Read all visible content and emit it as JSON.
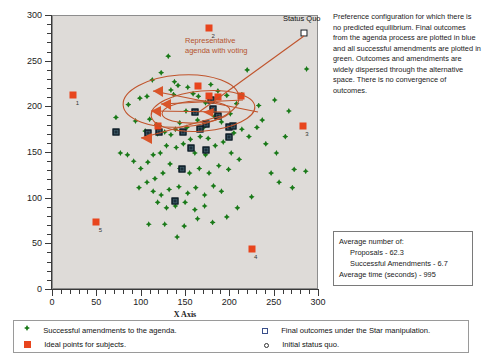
{
  "chart_data": {
    "type": "scatter",
    "title": "",
    "xlabel": "X Axis",
    "ylabel": "",
    "xlim": [
      0,
      300
    ],
    "ylim": [
      0,
      300
    ],
    "xticks": [
      0,
      50,
      100,
      150,
      200,
      250,
      300
    ],
    "yticks": [
      0,
      50,
      100,
      150,
      200,
      250,
      300
    ],
    "minor_tick_step": 10,
    "grid": false,
    "plot_background": "#dedbd8",
    "annotations": [
      {
        "name": "agenda-annotation",
        "text": "Representative\nagenda with voting",
        "color": "#b4532f"
      },
      {
        "name": "status-quo-annotation",
        "text": "Status Quo",
        "color": "#111111"
      }
    ],
    "series": [
      {
        "name": "Successful amendments to the agenda.",
        "marker": "diamond",
        "color": "#1a7a19",
        "points": [
          [
            130,
            256
          ],
          [
            122,
            238
          ],
          [
            112,
            230
          ],
          [
            137,
            228
          ],
          [
            141,
            224
          ],
          [
            133,
            219
          ],
          [
            136,
            214
          ],
          [
            152,
            222
          ],
          [
            158,
            215
          ],
          [
            164,
            212
          ],
          [
            98,
            210
          ],
          [
            106,
            212
          ],
          [
            85,
            203
          ],
          [
            71,
            189
          ],
          [
            93,
            185
          ],
          [
            109,
            187
          ],
          [
            117,
            181
          ],
          [
            120,
            180
          ],
          [
            178,
            225
          ],
          [
            186,
            218
          ],
          [
            196,
            213
          ],
          [
            172,
            205
          ],
          [
            150,
            196
          ],
          [
            160,
            195
          ],
          [
            143,
            183
          ],
          [
            151,
            178
          ],
          [
            138,
            176
          ],
          [
            126,
            173
          ],
          [
            133,
            170
          ],
          [
            118,
            171
          ],
          [
            104,
            174
          ],
          [
            163,
            186
          ],
          [
            170,
            178
          ],
          [
            182,
            190
          ],
          [
            190,
            184
          ],
          [
            200,
            193
          ],
          [
            207,
            204
          ],
          [
            213,
            214
          ],
          [
            219,
            241
          ],
          [
            232,
            202
          ],
          [
            175,
            166
          ],
          [
            166,
            168
          ],
          [
            155,
            165
          ],
          [
            147,
            160
          ],
          [
            139,
            156
          ],
          [
            128,
            158
          ],
          [
            121,
            150
          ],
          [
            113,
            148
          ],
          [
            107,
            140
          ],
          [
            99,
            133
          ],
          [
            91,
            141
          ],
          [
            84,
            148
          ],
          [
            76,
            150
          ],
          [
            160,
            150
          ],
          [
            172,
            148
          ],
          [
            183,
            158
          ],
          [
            192,
            162
          ],
          [
            201,
            150
          ],
          [
            210,
            143
          ],
          [
            198,
            132
          ],
          [
            187,
            136
          ],
          [
            176,
            128
          ],
          [
            165,
            133
          ],
          [
            154,
            128
          ],
          [
            143,
            133
          ],
          [
            132,
            138
          ],
          [
            124,
            128
          ],
          [
            115,
            122
          ],
          [
            106,
            118
          ],
          [
            97,
            112
          ],
          [
            113,
            108
          ],
          [
            122,
            104
          ],
          [
            131,
            110
          ],
          [
            142,
            113
          ],
          [
            152,
            106
          ],
          [
            161,
            112
          ],
          [
            171,
            104
          ],
          [
            181,
            114
          ],
          [
            190,
            108
          ],
          [
            149,
            96
          ],
          [
            138,
            92
          ],
          [
            128,
            90
          ],
          [
            118,
            96
          ],
          [
            160,
            88
          ],
          [
            171,
            92
          ],
          [
            240,
            160
          ],
          [
            252,
            150
          ],
          [
            262,
            168
          ],
          [
            246,
            128
          ],
          [
            266,
            196
          ],
          [
            230,
            178
          ],
          [
            221,
            168
          ],
          [
            213,
            176
          ],
          [
            204,
            172
          ],
          [
            236,
            186
          ],
          [
            108,
            72
          ],
          [
            126,
            72
          ],
          [
            148,
            70
          ],
          [
            163,
            78
          ],
          [
            180,
            74
          ],
          [
            196,
            80
          ],
          [
            208,
            90
          ],
          [
            224,
            102
          ],
          [
            140,
            58
          ],
          [
            255,
            118
          ],
          [
            272,
            132
          ],
          [
            285,
            130
          ],
          [
            250,
            208
          ],
          [
            286,
            242
          ],
          [
            270,
            112
          ]
        ]
      },
      {
        "name": "Final outcomes under the Star manipulation.",
        "marker": "square-blue",
        "color": "#1d2f3a",
        "points": [
          [
            160,
            195
          ],
          [
            178,
            208
          ],
          [
            180,
            198
          ],
          [
            186,
            190
          ],
          [
            198,
            178
          ],
          [
            203,
            180
          ],
          [
            199,
            167
          ],
          [
            172,
            182
          ],
          [
            166,
            176
          ],
          [
            147,
            173
          ],
          [
            71,
            173
          ],
          [
            107,
            172
          ],
          [
            119,
            173
          ],
          [
            156,
            155
          ],
          [
            172,
            153
          ],
          [
            146,
            132
          ],
          [
            138,
            97
          ]
        ]
      },
      {
        "name": "Ideal points for subjects.",
        "marker": "square-red",
        "color": "#e8451d",
        "points": [
          [
            23,
            214
          ],
          [
            176,
            287
          ],
          [
            282,
            180
          ],
          [
            224,
            45
          ],
          [
            49,
            74
          ],
          [
            186,
            211
          ],
          [
            212,
            212
          ],
          [
            176,
            212
          ],
          [
            164,
            223
          ],
          [
            118,
            180
          ]
        ],
        "labeled_points": [
          {
            "label": "1",
            "x": 23,
            "y": 214
          },
          {
            "label": "2",
            "x": 176,
            "y": 287
          },
          {
            "label": "3",
            "x": 282,
            "y": 180
          },
          {
            "label": "4",
            "x": 224,
            "y": 45
          },
          {
            "label": "5",
            "x": 49,
            "y": 74
          }
        ]
      },
      {
        "name": "Initial status quo.",
        "marker": "square-open",
        "color": "#111111",
        "points": [
          [
            283,
            281
          ]
        ]
      }
    ]
  },
  "description": {
    "name": "figure-description",
    "text": "Preference configuration for which there is no predicted equilibrium. Final outcomes from the agenda process are plotted in blue and all successful amendments are plotted in green.  Outcomes and amendments are widely dispersed through the alternative space.  There is no convergence of outcomes."
  },
  "stats_box": {
    "title": "Average number of:",
    "line_proposals": "Proposals - 62.3",
    "line_amendments": "Successful Amendments - 6.7",
    "line_time": "Average time (seconds) - 995"
  },
  "legend": {
    "items": [
      {
        "marker": "diamond-green-icon",
        "label": "Successful amendments to the agenda."
      },
      {
        "marker": "square-red-icon",
        "label": "Ideal points for subjects."
      },
      {
        "marker": "square-open-blue-icon",
        "label": "Final outcomes under the Star manipulation."
      },
      {
        "marker": "circle-small-icon",
        "label": "Initial status quo."
      }
    ]
  },
  "axis": {
    "x_title": "X Axis",
    "x_ticks": [
      "0",
      "50",
      "100",
      "150",
      "200",
      "250",
      "300"
    ],
    "y_ticks": [
      "0",
      "50",
      "100",
      "150",
      "200",
      "250",
      "300"
    ]
  },
  "colors": {
    "green": "#1a7a19",
    "red": "#e8451d",
    "blue": "#1d2f3a",
    "annotation": "#b4532f",
    "plot_bg": "#dedbd8"
  }
}
